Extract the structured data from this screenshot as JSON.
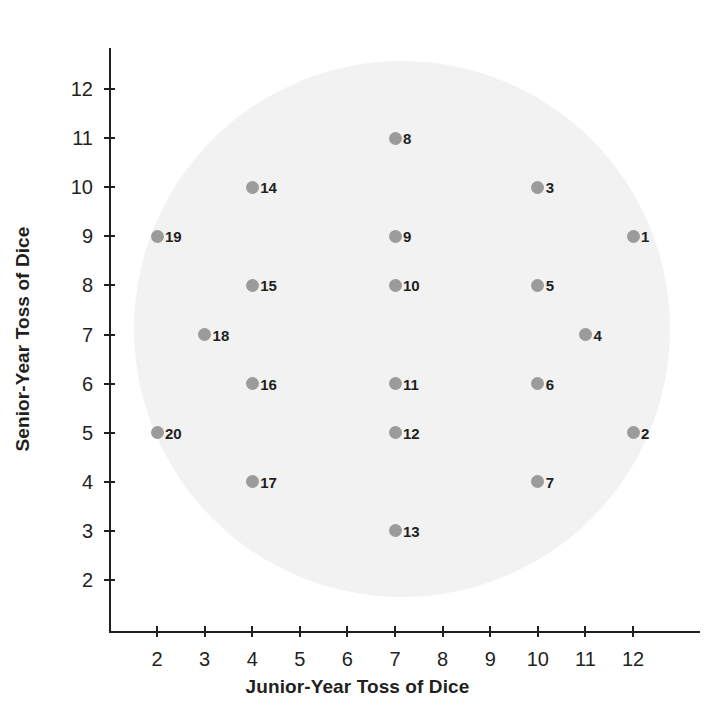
{
  "chart_data": {
    "type": "scatter",
    "title": "",
    "xlabel": "Junior-Year Toss of Dice",
    "ylabel": "Senior-Year Toss of Dice",
    "xlim": [
      1.4,
      12.7
    ],
    "ylim": [
      1.4,
      12.8
    ],
    "xticks": [
      2,
      3,
      4,
      5,
      6,
      7,
      8,
      9,
      10,
      11,
      12
    ],
    "yticks": [
      2,
      3,
      4,
      5,
      6,
      7,
      8,
      9,
      10,
      11,
      12
    ],
    "xtick_labels": [
      "2",
      "3",
      "4",
      "5",
      "6",
      "7",
      "8",
      "9",
      "10",
      "11",
      "12"
    ],
    "ytick_labels": [
      "2",
      "3",
      "4",
      "5",
      "6",
      "7",
      "8",
      "9",
      "10",
      "11",
      "12"
    ],
    "grid": false,
    "legend": "none",
    "marker_color": "#9b9b9b",
    "background_circle_color": "#f2f2f2",
    "axis_color": "#231f20",
    "points": [
      {
        "label": "1",
        "x": 12,
        "y": 9
      },
      {
        "label": "2",
        "x": 12,
        "y": 5
      },
      {
        "label": "3",
        "x": 10,
        "y": 10
      },
      {
        "label": "4",
        "x": 11,
        "y": 7
      },
      {
        "label": "5",
        "x": 10,
        "y": 8
      },
      {
        "label": "6",
        "x": 10,
        "y": 6
      },
      {
        "label": "7",
        "x": 10,
        "y": 4
      },
      {
        "label": "8",
        "x": 7,
        "y": 11
      },
      {
        "label": "9",
        "x": 7,
        "y": 9
      },
      {
        "label": "10",
        "x": 7,
        "y": 8
      },
      {
        "label": "11",
        "x": 7,
        "y": 6
      },
      {
        "label": "12",
        "x": 7,
        "y": 5
      },
      {
        "label": "13",
        "x": 7,
        "y": 3
      },
      {
        "label": "14",
        "x": 4,
        "y": 10
      },
      {
        "label": "15",
        "x": 4,
        "y": 8
      },
      {
        "label": "16",
        "x": 4,
        "y": 6
      },
      {
        "label": "17",
        "x": 4,
        "y": 4
      },
      {
        "label": "18",
        "x": 3,
        "y": 7
      },
      {
        "label": "19",
        "x": 2,
        "y": 9
      },
      {
        "label": "20",
        "x": 2,
        "y": 5
      }
    ]
  },
  "geometry": {
    "x_origin_px": 109,
    "y_origin_px": 631,
    "x_unit_px": 47.6,
    "y_unit_px": 49.1,
    "x_base_value": 2,
    "y_base_value": 2,
    "x_base_px": 157,
    "y_base_px": 580,
    "circle_cx": 402,
    "circle_cy": 329,
    "circle_r": 268
  }
}
